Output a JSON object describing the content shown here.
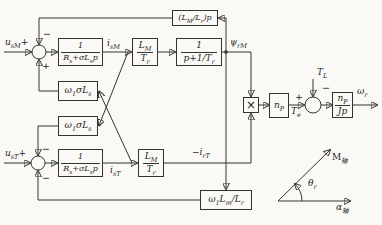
{
  "colors": {
    "line": "#333333",
    "text": "#1f1f1f",
    "background": "#faf9f6"
  },
  "inputs": {
    "u_sM": [
      [
        "t",
        "u"
      ],
      [
        "s",
        "sM"
      ],
      [
        "t",
        "+"
      ]
    ],
    "u_sT": [
      [
        "t",
        "u"
      ],
      [
        "s",
        "sT"
      ],
      [
        "t",
        "+"
      ]
    ]
  },
  "sums": {
    "m_axis": {
      "top_sign": "−",
      "bottom_sign": "+"
    },
    "t_axis": {
      "top_sign": "−",
      "bottom_sign": "−"
    },
    "torque": {
      "left_sign": "+",
      "top_sign": "−"
    }
  },
  "blocks": {
    "stator_tf": {
      "num": [
        [
          "t",
          "1"
        ]
      ],
      "den": [
        [
          "t",
          "R"
        ],
        [
          "s",
          "s"
        ],
        [
          "t",
          "+σL"
        ],
        [
          "s",
          "s"
        ],
        [
          "t",
          "p"
        ]
      ]
    },
    "lm_over_tr": {
      "num": [
        [
          "t",
          "L"
        ],
        [
          "s",
          "M"
        ]
      ],
      "den": [
        [
          "t",
          "T"
        ],
        [
          "s",
          "r"
        ]
      ]
    },
    "rotor_lag": {
      "num": [
        [
          "t",
          "1"
        ]
      ],
      "den": [
        [
          "t",
          "p+1/T"
        ],
        [
          "s",
          "r"
        ]
      ]
    },
    "flux_derivative": [
      [
        "t",
        "(L"
      ],
      [
        "s",
        "M"
      ],
      [
        "t",
        "/L"
      ],
      [
        "s",
        "r"
      ],
      [
        "t",
        ")p"
      ]
    ],
    "omega_sigma_ls": [
      [
        "t",
        "ω"
      ],
      [
        "s",
        "1"
      ],
      [
        "t",
        "σL"
      ],
      [
        "s",
        "s"
      ]
    ],
    "omega_lm_lr": [
      [
        "t",
        "ω"
      ],
      [
        "s",
        "1"
      ],
      [
        "t",
        "L"
      ],
      [
        "s",
        "m"
      ],
      [
        "t",
        "/L"
      ],
      [
        "s",
        "r"
      ]
    ],
    "multiplier": "×",
    "np": [
      [
        "t",
        "n"
      ],
      [
        "s",
        "P"
      ]
    ],
    "np_over_jp": {
      "num": [
        [
          "t",
          "n"
        ],
        [
          "s",
          "P"
        ]
      ],
      "den": [
        [
          "t",
          "Jp"
        ]
      ]
    }
  },
  "signals": {
    "i_sM": [
      [
        "t",
        "i"
      ],
      [
        "s",
        "sM"
      ]
    ],
    "i_sT": [
      [
        "t",
        "i"
      ],
      [
        "s",
        "sT"
      ]
    ],
    "psi_rM": [
      [
        "t",
        "ψ"
      ],
      [
        "s",
        "rM"
      ]
    ],
    "neg_i_rT": [
      [
        "t",
        "−i"
      ],
      [
        "s",
        "rT"
      ]
    ],
    "T_e": [
      [
        "t",
        "T"
      ],
      [
        "s",
        "e"
      ]
    ],
    "T_L": [
      [
        "t",
        "T"
      ],
      [
        "s",
        "L"
      ]
    ],
    "omega_r": [
      [
        "t",
        "ω"
      ],
      [
        "s",
        "r"
      ]
    ]
  },
  "axes_inset": {
    "m_axis_label": [
      [
        "t",
        "M"
      ],
      [
        "s",
        "轴"
      ]
    ],
    "alpha_axis_label": [
      [
        "t",
        "α"
      ],
      [
        "s",
        "轴"
      ]
    ],
    "theta_label": [
      [
        "t",
        "θ"
      ],
      [
        "s",
        "r"
      ]
    ]
  }
}
